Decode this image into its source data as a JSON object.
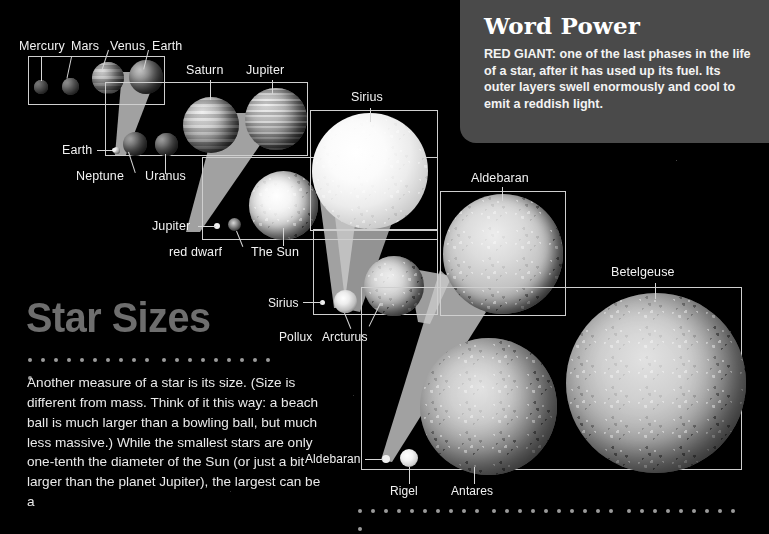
{
  "page": {
    "background_color": "#000000",
    "accent_color": "#4a4a4a",
    "frame_color": "#cfcfcf",
    "label_color": "#f2f2f2"
  },
  "word_power": {
    "title": "Word Power",
    "term": "RED GIANT:",
    "definition": "one of the last phases in the life of a star, after it has used up its fuel. Its outer layers swell enormously and cool to emit a reddish light.",
    "full_text": "RED GIANT: one of the last phases in the life of a star, after it has used up its fuel. Its outer layers swell enormously and cool to emit a reddish light."
  },
  "article": {
    "title": "Star Sizes",
    "body": "Another measure of a star is its size. (Size is different from mass. Think of it this way: a beach ball is much larger than a bowling ball, but much less massive.) While the smallest stars are only one-tenth the diameter of the Sun (or just a bit larger than the planet Jupiter), the largest can be a"
  },
  "diagram": {
    "type": "nested-scale-comparison",
    "caption": "Relative sizes of planets and stars shown in successively zoomed panels",
    "panels": [
      {
        "name": "panel-terrestrial",
        "objects": [
          "Mercury",
          "Mars",
          "Venus",
          "Earth"
        ]
      },
      {
        "name": "panel-gas-giants",
        "objects": [
          "Earth",
          "Neptune",
          "Uranus",
          "Saturn",
          "Jupiter"
        ]
      },
      {
        "name": "panel-sun",
        "objects": [
          "Jupiter",
          "red dwarf",
          "The Sun"
        ]
      },
      {
        "name": "panel-sirius",
        "objects": [
          "Sirius"
        ]
      },
      {
        "name": "panel-pollux",
        "objects": [
          "Sirius",
          "Pollux",
          "Arcturus"
        ]
      },
      {
        "name": "panel-aldebaran",
        "objects": [
          "Aldebaran"
        ]
      },
      {
        "name": "panel-betelgeuse",
        "objects": [
          "Aldebaran",
          "Rigel",
          "Antares",
          "Betelgeuse"
        ]
      }
    ],
    "labels": {
      "mercury": "Mercury",
      "mars": "Mars",
      "venus": "Venus",
      "earth_top": "Earth",
      "saturn": "Saturn",
      "jupiter_top": "Jupiter",
      "sirius_top": "Sirius",
      "earth_mid": "Earth",
      "neptune": "Neptune",
      "uranus": "Uranus",
      "jupiter_mid": "Jupiter",
      "red_dwarf": "red dwarf",
      "the_sun": "The Sun",
      "aldebaran_top": "Aldebaran",
      "betelgeuse": "Betelgeuse",
      "sirius_mid": "Sirius",
      "pollux": "Pollux",
      "arcturus": "Arcturus",
      "aldebaran_bottom": "Aldebaran",
      "rigel": "Rigel",
      "antares": "Antares"
    }
  }
}
